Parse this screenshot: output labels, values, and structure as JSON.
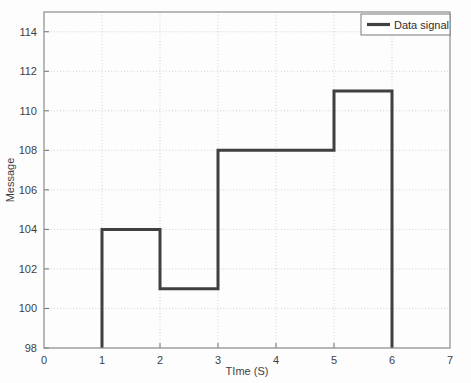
{
  "chart_data": {
    "type": "line",
    "title": "",
    "xlabel": "TIme (S)",
    "ylabel": "Message",
    "xlim": [
      0,
      7
    ],
    "ylim": [
      98,
      115
    ],
    "xticks": [
      0,
      1,
      2,
      3,
      4,
      5,
      6,
      7
    ],
    "yticks": [
      98,
      100,
      102,
      104,
      106,
      108,
      110,
      112,
      114
    ],
    "xtick_labels": [
      "0",
      "1",
      "2",
      "3",
      "4",
      "5",
      "6",
      "7"
    ],
    "ytick_labels": [
      "98",
      "100",
      "102",
      "104",
      "106",
      "108",
      "110",
      "112",
      "114"
    ],
    "grid": true,
    "grid_style": "dotted",
    "grid_color": "#cccccc",
    "legend_position": "top-right",
    "series": [
      {
        "name": "Data signal",
        "style": "step-post",
        "color": "#404040",
        "line_width": 3,
        "points": [
          {
            "x": 1,
            "y": 98
          },
          {
            "x": 1,
            "y": 104
          },
          {
            "x": 2,
            "y": 104
          },
          {
            "x": 2,
            "y": 101
          },
          {
            "x": 3,
            "y": 101
          },
          {
            "x": 3,
            "y": 108
          },
          {
            "x": 5,
            "y": 108
          },
          {
            "x": 5,
            "y": 111
          },
          {
            "x": 6,
            "y": 111
          },
          {
            "x": 6,
            "y": 98
          }
        ],
        "step_values": [
          {
            "interval": "1-2",
            "value": 104
          },
          {
            "interval": "2-3",
            "value": 101
          },
          {
            "interval": "3-5",
            "value": 108
          },
          {
            "interval": "5-6",
            "value": 111
          }
        ]
      }
    ]
  },
  "legend": {
    "entries": [
      {
        "label": "Data signal",
        "color": "#404040"
      }
    ]
  },
  "axes": {
    "frame_color": "#8c8c8c",
    "background": "#fdfdfd"
  }
}
